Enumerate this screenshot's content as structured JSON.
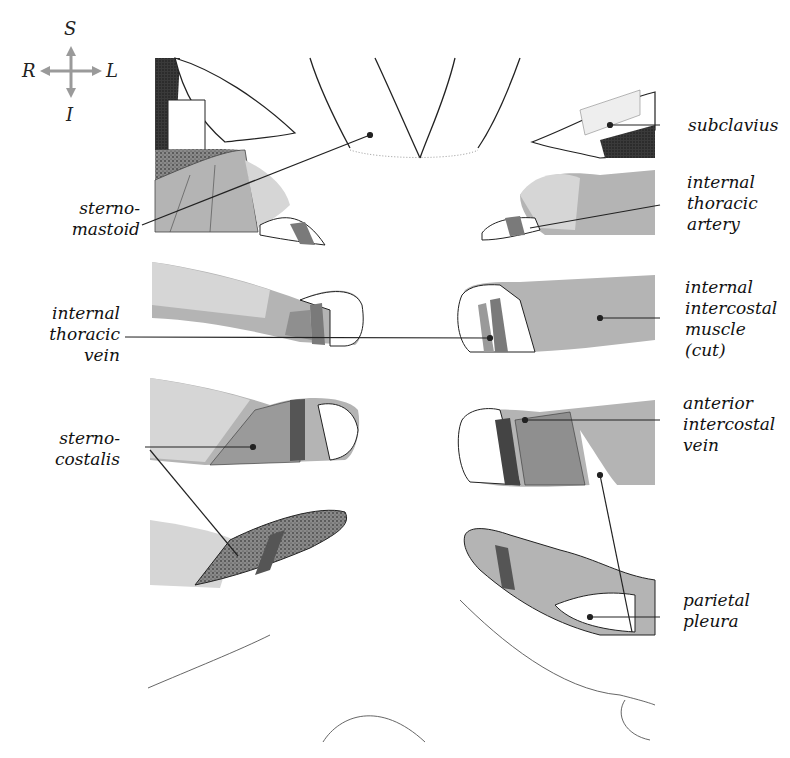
{
  "compass": {
    "superior": "S",
    "inferior": "I",
    "right": "R",
    "left": "L",
    "arrow_color": "#9a9a9a"
  },
  "labels": {
    "left": [
      {
        "id": "sternomastoid",
        "text": "sterno-\nmastoid"
      },
      {
        "id": "internal-thoracic-vein",
        "text": "internal\nthoracic\nvein"
      },
      {
        "id": "sternocostalis",
        "text": "sterno-\ncostalis"
      }
    ],
    "right": [
      {
        "id": "subclavius",
        "text": "subclavius"
      },
      {
        "id": "internal-thoracic-artery",
        "text": "internal\nthoracic\nartery"
      },
      {
        "id": "internal-intercostal-muscle",
        "text": "internal\nintercostal\nmuscle\n(cut)"
      },
      {
        "id": "anterior-intercostal-vein",
        "text": "anterior\nintercostal\nvein"
      },
      {
        "id": "parietal-pleura",
        "text": "parietal\npleura"
      }
    ]
  },
  "colors": {
    "light_gray": "#d6d6d6",
    "mid_gray": "#b4b4b4",
    "dark_gray": "#7a7a7a",
    "darkest": "#3c3c3c",
    "line": "#222222"
  }
}
